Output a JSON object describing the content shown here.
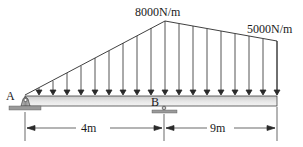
{
  "diagram": {
    "loads": {
      "peak_label": "8000N/m",
      "end_label": "5000N/m"
    },
    "supports": {
      "a_label": "A",
      "b_label": "B"
    },
    "dimensions": {
      "span_ab": "4m",
      "span_overhang": "9m"
    },
    "colors": {
      "line": "#2a2a2a",
      "beam_fill_top": "#d9d9d9",
      "beam_fill_bottom": "#f2f2f2",
      "support_fill": "#a8a8a8"
    }
  }
}
